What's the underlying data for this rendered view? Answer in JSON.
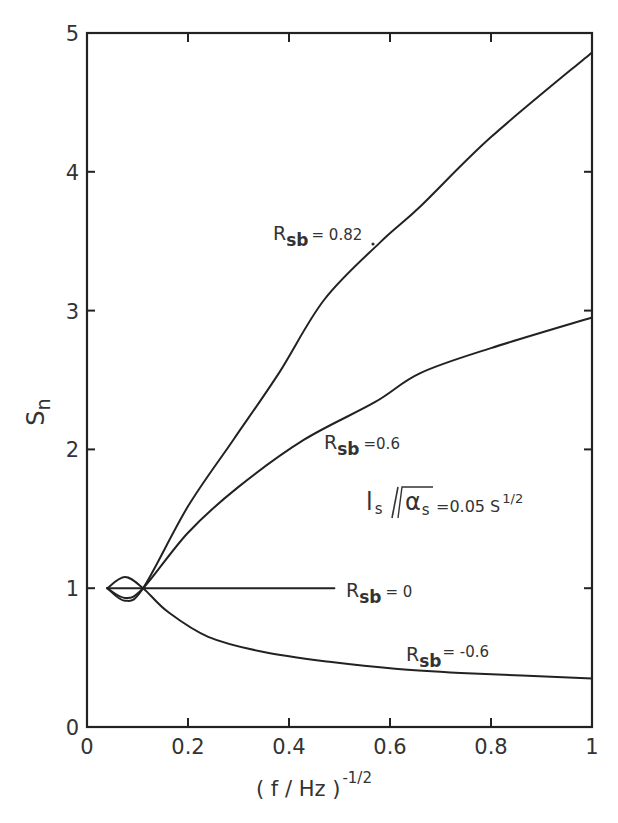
{
  "chart_data": {
    "type": "line",
    "title": "",
    "xlabel": "( f / Hz )^-1/2",
    "xlabel_base": "( f / Hz )",
    "xlabel_exponent": "-1/2",
    "ylabel": "S_n",
    "ylabel_base": "S",
    "ylabel_sub": "n",
    "xlim": [
      0,
      1
    ],
    "ylim": [
      0,
      5
    ],
    "grid": false,
    "legend": "inline labels",
    "x_ticks": [
      "0",
      "0.2",
      "0.4",
      "0.6",
      "0.8",
      "1"
    ],
    "y_ticks": [
      "0",
      "1",
      "2",
      "3",
      "4",
      "5"
    ],
    "annotation": {
      "text_main": "l",
      "text_sub": "s",
      "text_slash": "/",
      "text_root": "α",
      "text_root_sub": "s",
      "text_eq": "=0.05 S",
      "text_exp": "1/2",
      "full": "l_s / √α_s = 0.05 s^1/2"
    },
    "series": [
      {
        "name": "R_sb = 0.82",
        "label_base": "R",
        "label_sub": "sb",
        "label_value": "= 0.82",
        "points": [
          [
            0.04,
            1.0
          ],
          [
            0.075,
            0.91
          ],
          [
            0.111,
            1.0
          ],
          [
            0.2,
            1.59
          ],
          [
            0.29,
            2.07
          ],
          [
            0.38,
            2.55
          ],
          [
            0.47,
            3.08
          ],
          [
            0.58,
            3.49
          ],
          [
            0.66,
            3.75
          ],
          [
            0.8,
            4.25
          ],
          [
            1.0,
            4.86
          ]
        ]
      },
      {
        "name": "R_sb = 0.6",
        "label_base": "R",
        "label_sub": "sb",
        "label_value": "=0.6",
        "points": [
          [
            0.04,
            1.0
          ],
          [
            0.075,
            0.93
          ],
          [
            0.111,
            1.0
          ],
          [
            0.2,
            1.4
          ],
          [
            0.3,
            1.73
          ],
          [
            0.43,
            2.07
          ],
          [
            0.57,
            2.34
          ],
          [
            0.66,
            2.55
          ],
          [
            0.8,
            2.73
          ],
          [
            1.0,
            2.95
          ]
        ]
      },
      {
        "name": "R_sb = 0",
        "label_base": "R",
        "label_sub": "sb",
        "label_value": "= 0",
        "points": [
          [
            0.04,
            1.0
          ],
          [
            0.49,
            1.0
          ]
        ]
      },
      {
        "name": "R_sb = -0.6",
        "label_base": "R",
        "label_sub": "sb",
        "label_value": "= -0.6",
        "points": [
          [
            0.04,
            1.0
          ],
          [
            0.075,
            1.08
          ],
          [
            0.111,
            1.0
          ],
          [
            0.16,
            0.83
          ],
          [
            0.24,
            0.65
          ],
          [
            0.35,
            0.54
          ],
          [
            0.48,
            0.47
          ],
          [
            0.61,
            0.42
          ],
          [
            0.74,
            0.39
          ],
          [
            1.0,
            0.35
          ]
        ]
      }
    ]
  }
}
